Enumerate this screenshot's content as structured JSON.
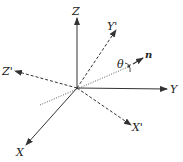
{
  "diagram": {
    "type": "coordinate-frame-rotation",
    "axes": {
      "original": [
        {
          "name": "X",
          "label": "X",
          "style": "solid"
        },
        {
          "name": "Y",
          "label": "Y",
          "style": "solid"
        },
        {
          "name": "Z",
          "label": "Z",
          "style": "solid"
        }
      ],
      "rotated": [
        {
          "name": "X'",
          "label": "X'",
          "style": "dashed"
        },
        {
          "name": "Y'",
          "label": "Y'",
          "style": "dashed"
        },
        {
          "name": "Z'",
          "label": "Z'",
          "style": "dashed"
        }
      ]
    },
    "rotation_axis": {
      "label": "n",
      "style": "dotted"
    },
    "angle": {
      "label": "θ"
    }
  },
  "colors": {
    "line": "#333333",
    "background": "#ffffff"
  }
}
